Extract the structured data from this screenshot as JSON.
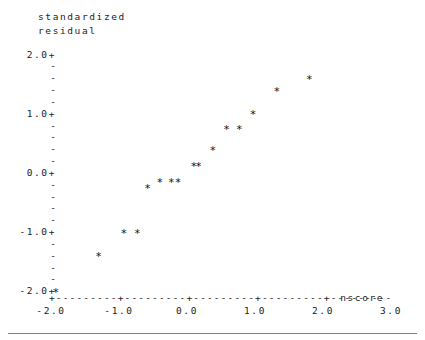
{
  "figure": {
    "kind": "character-plot",
    "y_axis_title_line1": "standardized",
    "y_axis_title_line2": "residual",
    "x_axis_name": "nscore",
    "tick_plus": "+",
    "tick_minor": "-",
    "axis_line": "+---------+---------+---------+---------+---------",
    "point_glyph": "*",
    "rule_color": "#808080",
    "text_color": "#222222"
  },
  "chart_data": {
    "type": "scatter",
    "title": "",
    "subtitle": "",
    "xlabel": "nscore",
    "ylabel": "standardized residual",
    "grid": false,
    "legend": "none",
    "xlim": [
      -2.5,
      3.3
    ],
    "ylim": [
      -2.25,
      2.15
    ],
    "y_major_ticks": [
      "2.0+",
      "1.0+",
      "0.0+",
      "-1.0+",
      "-2.0+"
    ],
    "y_major_values": [
      2.0,
      1.0,
      0.0,
      -1.0,
      -2.0
    ],
    "y_minor_per_interval": 4,
    "x_tick_labels": [
      "-2.0",
      "-1.0",
      "0.0",
      "1.0",
      "2.0",
      "3.0"
    ],
    "x_tick_values": [
      -2.0,
      -1.0,
      0.0,
      1.0,
      2.0,
      3.0
    ],
    "n_points": 16,
    "points": [
      {
        "nscore": -1.93,
        "residual": -2.0
      },
      {
        "nscore": -1.3,
        "residual": -1.4
      },
      {
        "nscore": -0.93,
        "residual": -1.0
      },
      {
        "nscore": -0.73,
        "residual": -1.0
      },
      {
        "nscore": -0.58,
        "residual": -0.25
      },
      {
        "nscore": -0.4,
        "residual": -0.15
      },
      {
        "nscore": -0.23,
        "residual": -0.15
      },
      {
        "nscore": -0.13,
        "residual": -0.15
      },
      {
        "nscore": 0.1,
        "residual": 0.12
      },
      {
        "nscore": 0.17,
        "residual": 0.12
      },
      {
        "nscore": 0.38,
        "residual": 0.4
      },
      {
        "nscore": 0.58,
        "residual": 0.75
      },
      {
        "nscore": 0.77,
        "residual": 0.75
      },
      {
        "nscore": 0.97,
        "residual": 1.0
      },
      {
        "nscore": 1.32,
        "residual": 1.4
      },
      {
        "nscore": 1.8,
        "residual": 1.6
      }
    ]
  }
}
